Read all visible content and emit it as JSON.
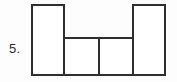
{
  "page": {
    "background_color": "#fdfdfd",
    "width": 177,
    "height": 82
  },
  "problem": {
    "number_label": "5.",
    "label_color": "#2b2b2b"
  },
  "figure": {
    "name": "composite-rectilinear-figure",
    "stroke_color": "#2e2e2e",
    "fill_color": "#ffffff",
    "stroke_width": 2,
    "rectangles": [
      {
        "name": "left-tall-rectangle",
        "x": 32,
        "y": 5,
        "width": 32,
        "height": 70
      },
      {
        "name": "inner-left-rectangle",
        "x": 64,
        "y": 38,
        "width": 35,
        "height": 37
      },
      {
        "name": "inner-right-rectangle",
        "x": 99,
        "y": 38,
        "width": 34,
        "height": 37
      },
      {
        "name": "right-tall-rectangle",
        "x": 133,
        "y": 5,
        "width": 32,
        "height": 70
      }
    ]
  },
  "chart_data": {
    "type": "diagram",
    "title": "",
    "xlabel": "",
    "ylabel": "",
    "shape": "composite-rectangles",
    "units": "pixels",
    "parts": [
      {
        "label": "left tall rectangle",
        "x": 32,
        "y": 5,
        "width": 32,
        "height": 70
      },
      {
        "label": "inner left rectangle",
        "x": 64,
        "y": 38,
        "width": 35,
        "height": 37
      },
      {
        "label": "inner right rectangle",
        "x": 99,
        "y": 38,
        "width": 34,
        "height": 37
      },
      {
        "label": "right tall rectangle",
        "x": 133,
        "y": 5,
        "width": 32,
        "height": 70
      }
    ],
    "outline_points": [
      [
        32,
        5
      ],
      [
        64,
        5
      ],
      [
        64,
        38
      ],
      [
        133,
        38
      ],
      [
        133,
        5
      ],
      [
        165,
        5
      ],
      [
        165,
        75
      ],
      [
        32,
        75
      ]
    ],
    "internal_dividers": [
      {
        "name": "left-inner-vertical",
        "x1": 64,
        "y1": 38,
        "x2": 64,
        "y2": 75
      },
      {
        "name": "center-vertical",
        "x1": 99,
        "y1": 38,
        "x2": 99,
        "y2": 75
      },
      {
        "name": "right-inner-vertical",
        "x1": 133,
        "y1": 38,
        "x2": 133,
        "y2": 75
      }
    ]
  }
}
